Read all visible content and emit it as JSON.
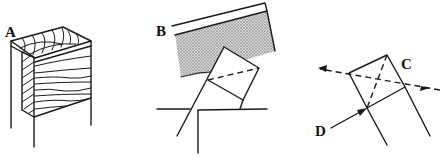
{
  "figure": {
    "panels": [
      {
        "id": "A",
        "label": "A",
        "description": "block of wood showing end grain, face grain and hatched edge"
      },
      {
        "id": "B",
        "label": "B",
        "description": "saw blade over a square piece resting on a stepped ledge"
      },
      {
        "id": "C",
        "label": "C",
        "description": "square section with dashed diagonal and dashed arrow line"
      }
    ],
    "labels": {
      "a": "A",
      "b": "B",
      "c": "C",
      "d": "D"
    },
    "colors": {
      "line": "#1a1a1a",
      "background": "#ffffff",
      "blade_shading": "#b8b8b8"
    }
  }
}
